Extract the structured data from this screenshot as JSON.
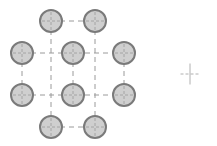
{
  "diagram": {
    "type": "bolt-pattern",
    "colors": {
      "circle_fill": "#cfcfcf",
      "circle_stroke": "#7a7a7a",
      "dash": "#9a9a9a",
      "crosshair": "#b0b0b0"
    },
    "radius": 11,
    "circles": [
      {
        "x": 51,
        "y": 21
      },
      {
        "x": 95,
        "y": 21
      },
      {
        "x": 22,
        "y": 53
      },
      {
        "x": 73,
        "y": 53
      },
      {
        "x": 124,
        "y": 53
      },
      {
        "x": 22,
        "y": 95
      },
      {
        "x": 73,
        "y": 95
      },
      {
        "x": 124,
        "y": 95
      },
      {
        "x": 51,
        "y": 127
      },
      {
        "x": 95,
        "y": 127
      }
    ],
    "lines": [
      {
        "x1": 51,
        "y1": 21,
        "x2": 51,
        "y2": 127
      },
      {
        "x1": 95,
        "y1": 21,
        "x2": 95,
        "y2": 127
      },
      {
        "x1": 22,
        "y1": 53,
        "x2": 124,
        "y2": 53
      },
      {
        "x1": 22,
        "y1": 95,
        "x2": 124,
        "y2": 95
      },
      {
        "x1": 51,
        "y1": 21,
        "x2": 95,
        "y2": 21
      },
      {
        "x1": 51,
        "y1": 127,
        "x2": 95,
        "y2": 127
      },
      {
        "x1": 22,
        "y1": 53,
        "x2": 22,
        "y2": 95
      },
      {
        "x1": 73,
        "y1": 53,
        "x2": 73,
        "y2": 95
      },
      {
        "x1": 124,
        "y1": 53,
        "x2": 124,
        "y2": 95
      }
    ],
    "origin_marker": {
      "x": 190,
      "y": 74,
      "size": 19
    }
  }
}
